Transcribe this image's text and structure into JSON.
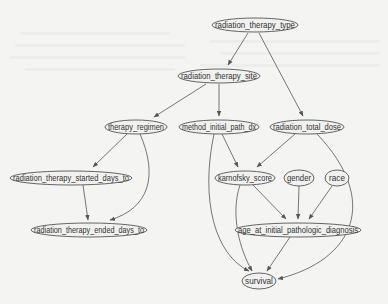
{
  "diagram": {
    "type": "directed-acyclic-graph",
    "colors": {
      "background": "#f4f4f2",
      "node_fill": "#f1f1ef",
      "node_stroke": "#555555",
      "edge": "#555555",
      "text": "#333333"
    },
    "nodes": [
      {
        "id": "radiation_therapy_type",
        "label": "radiation_therapy_type",
        "cx": 255,
        "cy": 25,
        "rx": 43,
        "ry": 7
      },
      {
        "id": "radiation_therapy_site",
        "label": "radiation_therapy_site",
        "cx": 219,
        "cy": 76,
        "rx": 41,
        "ry": 7
      },
      {
        "id": "therapy_regimen",
        "label": "therapy_regimen",
        "cx": 136,
        "cy": 127,
        "rx": 31,
        "ry": 7
      },
      {
        "id": "method_initial_path_dx",
        "label": "method_initial_path_dx",
        "cx": 219,
        "cy": 127,
        "rx": 40,
        "ry": 7
      },
      {
        "id": "radiation_total_dose",
        "label": "radiation_total_dose",
        "cx": 307,
        "cy": 127,
        "rx": 37,
        "ry": 7
      },
      {
        "id": "radiation_therapy_started_days_to",
        "label": "radiation_therapy_started_days_to",
        "cx": 71,
        "cy": 178,
        "rx": 61,
        "ry": 7
      },
      {
        "id": "karnofsky_score",
        "label": "karnofsky_score",
        "cx": 245,
        "cy": 178,
        "rx": 30,
        "ry": 7
      },
      {
        "id": "gender",
        "label": "gender",
        "cx": 299,
        "cy": 178,
        "rx": 15,
        "ry": 8
      },
      {
        "id": "race",
        "label": "race",
        "cx": 337,
        "cy": 178,
        "rx": 12,
        "ry": 8
      },
      {
        "id": "radiation_therapy_ended_days_to",
        "label": "radiation_therapy_ended_days_to",
        "cx": 89,
        "cy": 230,
        "rx": 58,
        "ry": 7
      },
      {
        "id": "age_at_initial_pathologic_diagnosis",
        "label": "age_at_initial_pathologic_diagnosis",
        "cx": 298,
        "cy": 230,
        "rx": 63,
        "ry": 7
      },
      {
        "id": "survival",
        "label": "survival",
        "cx": 259,
        "cy": 281,
        "rx": 17,
        "ry": 8
      }
    ],
    "edges": [
      {
        "from": "radiation_therapy_type",
        "to": "radiation_therapy_site",
        "path": "M248 33 L228 65"
      },
      {
        "from": "radiation_therapy_type",
        "to": "radiation_total_dose",
        "path": "M259 33 L303 116"
      },
      {
        "from": "radiation_therapy_site",
        "to": "therapy_regimen",
        "path": "M206 84 L154 117"
      },
      {
        "from": "radiation_therapy_site",
        "to": "method_initial_path_dx",
        "path": "M219 84 L219 116"
      },
      {
        "from": "therapy_regimen",
        "to": "radiation_therapy_started_days_to",
        "path": "M127 134 L93 167"
      },
      {
        "from": "therapy_regimen",
        "to": "radiation_therapy_ended_days_to",
        "path": "M140 134 C158 175 150 208 110 220"
      },
      {
        "from": "radiation_therapy_started_days_to",
        "to": "radiation_therapy_ended_days_to",
        "path": "M83 185 L88 220"
      },
      {
        "from": "method_initial_path_dx",
        "to": "karnofsky_score",
        "path": "M222 134 L238 167"
      },
      {
        "from": "method_initial_path_dx",
        "to": "survival",
        "path": "M214 134 C200 200 215 255 249 271"
      },
      {
        "from": "radiation_total_dose",
        "to": "karnofsky_score",
        "path": "M295 134 L257 167"
      },
      {
        "from": "radiation_total_dose",
        "to": "survival",
        "path": "M317 134 C380 200 355 260 278 279"
      },
      {
        "from": "karnofsky_score",
        "to": "age_at_initial_pathologic_diagnosis",
        "path": "M253 185 L286 219"
      },
      {
        "from": "karnofsky_score",
        "to": "survival",
        "path": "M240 185 C230 215 240 250 252 271"
      },
      {
        "from": "gender",
        "to": "age_at_initial_pathologic_diagnosis",
        "path": "M299 186 L298 219"
      },
      {
        "from": "race",
        "to": "age_at_initial_pathologic_diagnosis",
        "path": "M332 186 L309 219"
      },
      {
        "from": "age_at_initial_pathologic_diagnosis",
        "to": "survival",
        "path": "M290 237 L267 271"
      }
    ]
  }
}
